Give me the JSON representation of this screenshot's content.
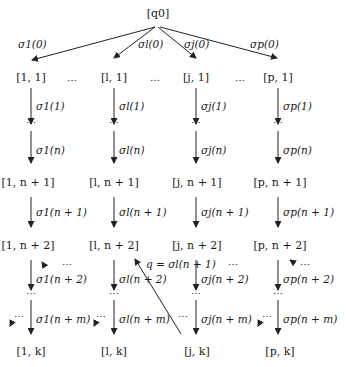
{
  "root": {
    "label": "[q0]"
  },
  "root_edges": [
    {
      "label": "σ1(0)"
    },
    {
      "label": "σl(0)"
    },
    {
      "label": "σj(0)"
    },
    {
      "label": "σp(0)"
    }
  ],
  "separator": "…",
  "columns": [
    {
      "id": "1",
      "nodes": [
        "[1, 1]",
        "[1, n + 1]",
        "[1, n + 2]",
        "[1, k]"
      ],
      "edges": [
        "σ1(1)",
        "σ1(n)",
        "σ1(n + 1)",
        "σ1(n + 2)",
        "σ1(n + m)"
      ]
    },
    {
      "id": "l",
      "nodes": [
        "[l, 1]",
        "[l, n + 1]",
        "[l, n + 2]",
        "[l, k]"
      ],
      "edges": [
        "σl(1)",
        "σl(n)",
        "σl(n + 1)",
        "σl(n + 2)",
        "σl(n + m)"
      ]
    },
    {
      "id": "j",
      "nodes": [
        "[j, 1]",
        "[j, n + 1]",
        "[j, n + 2]",
        "[j, k]"
      ],
      "edges": [
        "σj(1)",
        "σj(n)",
        "σj(n + 1)",
        "σj(n + 2)",
        "σj(n + m)"
      ]
    },
    {
      "id": "p",
      "nodes": [
        "[p, 1]",
        "[p, n + 1]",
        "[p, n + 2]",
        "[p, k]"
      ],
      "edges": [
        "σp(1)",
        "σp(n)",
        "σp(n + 1)",
        "σp(n + 2)",
        "σp(n + m)"
      ]
    }
  ],
  "cross_edge": {
    "label": "q = σl(n + 1)"
  },
  "colors": {
    "ink": "#1a1a1a",
    "background": "#ffffff"
  }
}
